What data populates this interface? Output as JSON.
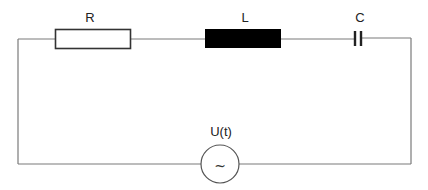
{
  "diagram": {
    "type": "series RLC circuit",
    "components": [
      {
        "id": "resistor",
        "label": "R",
        "symbol": "rectangle-outline"
      },
      {
        "id": "inductor",
        "label": "L",
        "symbol": "filled-rectangle"
      },
      {
        "id": "capacitor",
        "label": "C",
        "symbol": "parallel-plates"
      },
      {
        "id": "source",
        "label": "U(t)",
        "symbol": "ac-source-circle",
        "glyph": "~"
      }
    ],
    "colors": {
      "wire": "#7a7a7a",
      "resistor_outline": "#333333",
      "inductor_fill": "#000000",
      "capacitor_plates": "#222222",
      "source_outline": "#555555",
      "background": "#ffffff"
    }
  },
  "labels": {
    "resistor": "R",
    "inductor": "L",
    "capacitor": "C",
    "source": "U(t)",
    "source_glyph": "~"
  }
}
